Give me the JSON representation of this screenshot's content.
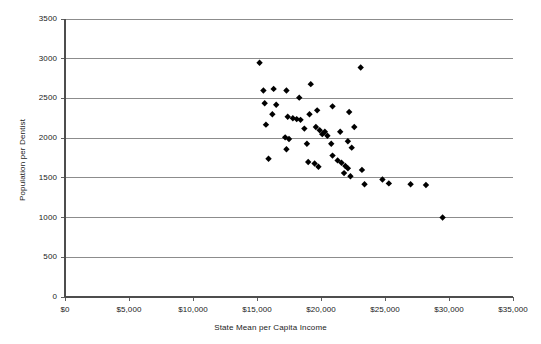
{
  "chart_data": {
    "type": "scatter",
    "title": "",
    "xlabel": "State Mean per Capita Income",
    "ylabel": "Population per Dentist",
    "xlim": [
      0,
      35000
    ],
    "ylim": [
      0,
      3500
    ],
    "grid": "horizontal",
    "legend": "none",
    "marker": "diamond",
    "marker_color": "#000000",
    "xticks": [
      0,
      5000,
      10000,
      15000,
      20000,
      25000,
      30000,
      35000
    ],
    "xtick_labels": [
      "$0",
      "$5,000",
      "$10,000",
      "$15,000",
      "$20,000",
      "$25,000",
      "$30,000",
      "$35,000"
    ],
    "yticks": [
      0,
      500,
      1000,
      1500,
      2000,
      2500,
      3000,
      3500
    ],
    "ytick_labels": [
      "0",
      "500",
      "1000",
      "1500",
      "2000",
      "2500",
      "3000",
      "3500"
    ],
    "n_points": 51,
    "points": [
      {
        "x": 15200,
        "y": 2950
      },
      {
        "x": 15500,
        "y": 2600
      },
      {
        "x": 16300,
        "y": 2620
      },
      {
        "x": 17300,
        "y": 2600
      },
      {
        "x": 15600,
        "y": 2440
      },
      {
        "x": 16500,
        "y": 2420
      },
      {
        "x": 18300,
        "y": 2510
      },
      {
        "x": 19200,
        "y": 2680
      },
      {
        "x": 16200,
        "y": 2300
      },
      {
        "x": 17400,
        "y": 2270
      },
      {
        "x": 17800,
        "y": 2250
      },
      {
        "x": 18100,
        "y": 2240
      },
      {
        "x": 18400,
        "y": 2230
      },
      {
        "x": 19100,
        "y": 2300
      },
      {
        "x": 19700,
        "y": 2350
      },
      {
        "x": 20900,
        "y": 2400
      },
      {
        "x": 22200,
        "y": 2330
      },
      {
        "x": 15700,
        "y": 2170
      },
      {
        "x": 17200,
        "y": 2010
      },
      {
        "x": 17500,
        "y": 1990
      },
      {
        "x": 18700,
        "y": 2120
      },
      {
        "x": 19600,
        "y": 2140
      },
      {
        "x": 19900,
        "y": 2100
      },
      {
        "x": 20100,
        "y": 2050
      },
      {
        "x": 20300,
        "y": 2080
      },
      {
        "x": 20500,
        "y": 2030
      },
      {
        "x": 21500,
        "y": 2080
      },
      {
        "x": 22600,
        "y": 2140
      },
      {
        "x": 23100,
        "y": 2890
      },
      {
        "x": 15900,
        "y": 1740
      },
      {
        "x": 17300,
        "y": 1860
      },
      {
        "x": 18900,
        "y": 1930
      },
      {
        "x": 20800,
        "y": 1930
      },
      {
        "x": 22100,
        "y": 1960
      },
      {
        "x": 19000,
        "y": 1700
      },
      {
        "x": 19500,
        "y": 1680
      },
      {
        "x": 19800,
        "y": 1640
      },
      {
        "x": 20900,
        "y": 1780
      },
      {
        "x": 21300,
        "y": 1720
      },
      {
        "x": 21600,
        "y": 1690
      },
      {
        "x": 21900,
        "y": 1650
      },
      {
        "x": 22100,
        "y": 1620
      },
      {
        "x": 22400,
        "y": 1880
      },
      {
        "x": 21800,
        "y": 1560
      },
      {
        "x": 22300,
        "y": 1520
      },
      {
        "x": 23200,
        "y": 1600
      },
      {
        "x": 23400,
        "y": 1420
      },
      {
        "x": 24800,
        "y": 1480
      },
      {
        "x": 25300,
        "y": 1430
      },
      {
        "x": 27000,
        "y": 1420
      },
      {
        "x": 28200,
        "y": 1410
      },
      {
        "x": 29500,
        "y": 1000
      }
    ]
  }
}
